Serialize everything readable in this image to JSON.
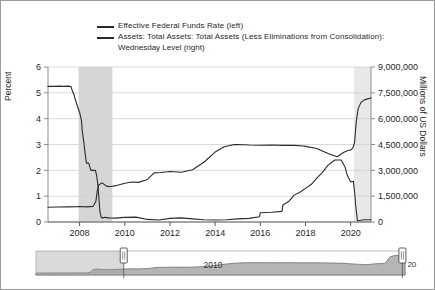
{
  "chart_data": {
    "type": "line",
    "title": "",
    "subtitle": "",
    "xlabel": "",
    "grid": true,
    "legend_position": "top",
    "axes": {
      "left": {
        "label": "Percent",
        "ticks": [
          "0",
          "1",
          "2",
          "3",
          "4",
          "5",
          "6"
        ],
        "values": [
          0,
          1,
          2,
          3,
          4,
          5,
          6
        ],
        "ylim": [
          0,
          6
        ]
      },
      "right": {
        "label": "Millions of US Dollars",
        "ticks": [
          "0",
          "1,500,000",
          "3,000,000",
          "4,500,000",
          "6,000,000",
          "7,500,000",
          "9,000,000"
        ],
        "values": [
          0,
          1500000,
          3000000,
          4500000,
          6000000,
          7500000,
          9000000
        ],
        "ylim": [
          0,
          9000000
        ]
      },
      "x": {
        "ticks": [
          "2008",
          "2010",
          "2012",
          "2014",
          "2016",
          "2018",
          "2020"
        ],
        "values": [
          2008,
          2010,
          2012,
          2014,
          2016,
          2018,
          2020
        ],
        "xlim": [
          2006.6,
          2020.9
        ]
      }
    },
    "legend": [
      {
        "label": "Effective Federal Funds Rate (left)",
        "color": "#2b2b2b",
        "axis": "left"
      },
      {
        "label": "Assets: Total Assets: Total Assets (Less Eliminations from Consolidation):",
        "label_cont": "Wednesday Level (right)",
        "color": "#2b2b2b",
        "axis": "right"
      }
    ],
    "recession_bands": [
      {
        "start": 2007.95,
        "end": 2009.45,
        "color": "#d6d6d6"
      },
      {
        "start": 2020.15,
        "end": 2020.9,
        "color": "#e8e8e8"
      }
    ],
    "series": [
      {
        "name": "Effective Federal Funds Rate (left)",
        "axis": "left",
        "unit": "Percent",
        "color": "#2b2b2b",
        "x": [
          2006.6,
          2006.9,
          2007.1,
          2007.3,
          2007.5,
          2007.62,
          2007.7,
          2007.75,
          2007.8,
          2007.9,
          2008.0,
          2008.08,
          2008.12,
          2008.2,
          2008.25,
          2008.3,
          2008.4,
          2008.5,
          2008.6,
          2008.7,
          2008.75,
          2008.8,
          2008.85,
          2008.9,
          2008.95,
          2009.0,
          2009.1,
          2009.3,
          2009.6,
          2010.0,
          2010.5,
          2011.0,
          2011.5,
          2012.0,
          2012.5,
          2013.0,
          2013.5,
          2014.0,
          2014.5,
          2015.0,
          2015.5,
          2015.96,
          2016.0,
          2016.5,
          2016.96,
          2017.0,
          2017.25,
          2017.5,
          2017.75,
          2018.0,
          2018.25,
          2018.5,
          2018.75,
          2019.0,
          2019.3,
          2019.58,
          2019.75,
          2019.84,
          2020.0,
          2020.12,
          2020.18,
          2020.22,
          2020.3,
          2020.6,
          2020.9
        ],
        "y": [
          5.25,
          5.25,
          5.26,
          5.25,
          5.26,
          5.24,
          5.02,
          4.94,
          4.76,
          4.49,
          4.24,
          3.94,
          3.5,
          3.0,
          2.61,
          2.28,
          2.28,
          2.0,
          2.0,
          2.0,
          1.81,
          1.5,
          0.97,
          0.39,
          0.21,
          0.15,
          0.18,
          0.16,
          0.15,
          0.18,
          0.19,
          0.1,
          0.08,
          0.14,
          0.16,
          0.12,
          0.09,
          0.08,
          0.09,
          0.12,
          0.14,
          0.2,
          0.36,
          0.38,
          0.41,
          0.66,
          0.79,
          1.04,
          1.15,
          1.3,
          1.45,
          1.7,
          1.92,
          2.2,
          2.4,
          2.4,
          2.13,
          1.83,
          1.55,
          1.58,
          1.1,
          0.65,
          0.05,
          0.09,
          0.09
        ]
      },
      {
        "name": "Assets: Total Assets: Total Assets (Less Eliminations from Consolidation): Wednesday Level (right)",
        "axis": "right",
        "unit": "Millions of US Dollars",
        "color": "#2b2b2b",
        "x": [
          2006.6,
          2007.0,
          2007.5,
          2007.9,
          2008.0,
          2008.3,
          2008.6,
          2008.72,
          2008.78,
          2008.85,
          2008.95,
          2009.0,
          2009.2,
          2009.4,
          2009.6,
          2009.8,
          2010.0,
          2010.3,
          2010.6,
          2010.9,
          2011.0,
          2011.3,
          2011.6,
          2011.9,
          2012.0,
          2012.5,
          2013.0,
          2013.5,
          2014.0,
          2014.4,
          2014.8,
          2015.0,
          2015.5,
          2016.0,
          2016.5,
          2017.0,
          2017.5,
          2017.9,
          2018.0,
          2018.5,
          2019.0,
          2019.4,
          2019.7,
          2019.9,
          2020.0,
          2020.1,
          2020.17,
          2020.25,
          2020.33,
          2020.45,
          2020.6,
          2020.75,
          2020.9
        ],
        "y": [
          855000,
          873000,
          880000,
          890000,
          900000,
          880000,
          910000,
          1200000,
          1800000,
          2150000,
          2240000,
          2270000,
          2070000,
          2060000,
          2110000,
          2180000,
          2250000,
          2320000,
          2300000,
          2420000,
          2470000,
          2850000,
          2870000,
          2920000,
          2930000,
          2890000,
          3030000,
          3470000,
          4060000,
          4370000,
          4490000,
          4500000,
          4470000,
          4460000,
          4470000,
          4450000,
          4450000,
          4410000,
          4390000,
          4270000,
          3980000,
          3790000,
          4050000,
          4170000,
          4170000,
          4310000,
          4600000,
          5860000,
          6570000,
          6930000,
          7090000,
          7150000,
          7200000
        ]
      }
    ]
  },
  "navigator": {
    "left_handle_label": "",
    "center_label": "2010",
    "right_handle_label": "20",
    "selection_start": 2010.0,
    "selection_end": 2020.8,
    "track_color": "#c9c9c9",
    "area_color": "#b5b5b5"
  }
}
